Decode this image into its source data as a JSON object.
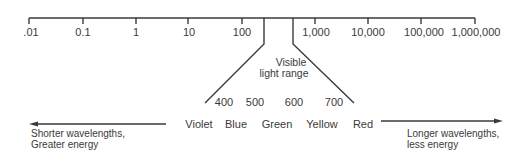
{
  "diagram": {
    "axis": {
      "ticks": [
        ".01",
        "0.1",
        "1",
        "10",
        "100",
        "1,000",
        "10,000",
        "100,000",
        "1,000,000"
      ]
    },
    "visible_range_label": [
      "Visible",
      "light range"
    ],
    "visible_wavelengths": [
      "400",
      "500",
      "600",
      "700"
    ],
    "colors": [
      "Violet",
      "Blue",
      "Green",
      "Yellow",
      "Red"
    ],
    "left_arrow_text": [
      "Shorter wavelengths,",
      "Greater energy"
    ],
    "right_arrow_text": [
      "Longer wavelengths,",
      "less energy"
    ],
    "line_color": "#3a3a3a"
  }
}
